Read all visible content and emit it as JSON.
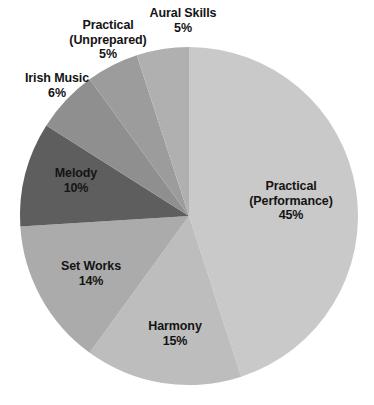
{
  "chart_data": {
    "type": "pie",
    "title": "",
    "subtitle": "",
    "xlabel": "",
    "ylabel": "",
    "legend_position": "none",
    "grid": false,
    "start_angle_deg": 0,
    "direction": "clockwise",
    "units": "percent",
    "categories": [
      "Practical (Performance)",
      "Harmony",
      "Set Works",
      "Melody",
      "Irish Music",
      "Practical (Unprepared)",
      "Aural Skills"
    ],
    "values": [
      45,
      15,
      14,
      10,
      6,
      5,
      5
    ],
    "colors": [
      "#c9c9c9",
      "#bdbdbd",
      "#ababab",
      "#5e5e5e",
      "#8f8f8f",
      "#9c9c9c",
      "#b0b0b0"
    ],
    "slices": [
      {
        "id": "practical-performance",
        "name": "Practical",
        "name_line2": "(Performance)",
        "value": 45,
        "value_label": "45%",
        "color": "#c9c9c9",
        "label_placement": "inside"
      },
      {
        "id": "harmony",
        "name": "Harmony",
        "name_line2": "",
        "value": 15,
        "value_label": "15%",
        "color": "#bdbdbd",
        "label_placement": "inside"
      },
      {
        "id": "set-works",
        "name": "Set Works",
        "name_line2": "",
        "value": 14,
        "value_label": "14%",
        "color": "#ababab",
        "label_placement": "inside"
      },
      {
        "id": "melody",
        "name": "Melody",
        "name_line2": "",
        "value": 10,
        "value_label": "10%",
        "color": "#5e5e5e",
        "label_placement": "inside"
      },
      {
        "id": "irish-music",
        "name": "Irish Music",
        "name_line2": "",
        "value": 6,
        "value_label": "6%",
        "color": "#8f8f8f",
        "label_placement": "outside"
      },
      {
        "id": "practical-unprepared",
        "name": "Practical",
        "name_line2": "(Unprepared)",
        "value": 5,
        "value_label": "5%",
        "color": "#9c9c9c",
        "label_placement": "outside"
      },
      {
        "id": "aural-skills",
        "name": "Aural Skills",
        "name_line2": "",
        "value": 5,
        "value_label": "5%",
        "color": "#b0b0b0",
        "label_placement": "outside"
      }
    ],
    "geometry": {
      "cx": 189,
      "cy": 216,
      "r": 169
    },
    "background_color": "#ffffff",
    "label_text_color": "#141414"
  }
}
